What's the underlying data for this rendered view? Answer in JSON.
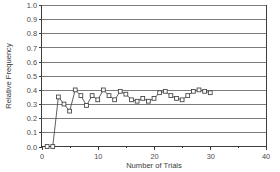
{
  "chart_data": {
    "type": "line",
    "title": "",
    "subtitle": "",
    "xlabel": "Number of Trials",
    "ylabel": "Relative Frequency",
    "xlim": [
      0,
      40
    ],
    "ylim": [
      0.0,
      1.0
    ],
    "grid": "horizontal",
    "legend": "none",
    "marker": "open-square",
    "x_ticks": [
      0,
      10,
      20,
      30,
      40
    ],
    "x_tick_labels": [
      "0",
      "10",
      "20",
      "30",
      "40"
    ],
    "x_minor_ticks": [
      5,
      15,
      25,
      35
    ],
    "y_ticks": [
      0.0,
      0.1,
      0.2,
      0.3,
      0.4,
      0.5,
      0.6,
      0.7,
      0.8,
      0.9,
      1.0
    ],
    "y_tick_labels": [
      "0.0",
      "0.1",
      "0.2",
      "0.3",
      "0.4",
      "0.5",
      "0.6",
      "0.7",
      "0.8",
      "0.9",
      "1.0"
    ],
    "series": [
      {
        "name": "Relative Frequency",
        "x": [
          1,
          2,
          3,
          4,
          5,
          6,
          7,
          8,
          9,
          10,
          11,
          12,
          13,
          14,
          15,
          16,
          17,
          18,
          19,
          20,
          21,
          22,
          23,
          24,
          25,
          26,
          27,
          28,
          29,
          30
        ],
        "values": [
          0.0,
          0.0,
          0.35,
          0.3,
          0.25,
          0.4,
          0.36,
          0.29,
          0.36,
          0.33,
          0.4,
          0.36,
          0.33,
          0.39,
          0.37,
          0.33,
          0.32,
          0.34,
          0.32,
          0.34,
          0.38,
          0.39,
          0.36,
          0.34,
          0.33,
          0.36,
          0.39,
          0.4,
          0.39,
          0.38
        ]
      }
    ]
  },
  "axes": {
    "x_title": "Number of Trials",
    "y_title": "Relative Frequency"
  }
}
